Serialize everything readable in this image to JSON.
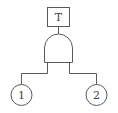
{
  "diagram": {
    "type": "fault-tree",
    "top_event": {
      "label": "T",
      "shape": "rectangle"
    },
    "gate": {
      "type": "AND",
      "shape": "and-gate"
    },
    "basic_events": [
      {
        "label": "1",
        "shape": "circle"
      },
      {
        "label": "2",
        "shape": "circle"
      }
    ],
    "colors": {
      "line": "#5a5a5a",
      "text": "#444444",
      "background": "#ffffff"
    }
  }
}
